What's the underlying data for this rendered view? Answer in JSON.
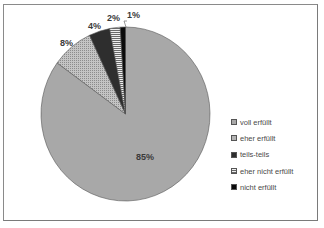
{
  "chart_data": {
    "type": "pie",
    "title": "",
    "categories": [
      "voll erfüllt",
      "eher erfüllt",
      "teils-teils",
      "eher nicht erfüllt",
      "nicht erfüllt"
    ],
    "values": [
      85,
      8,
      4,
      2,
      1
    ],
    "labels": [
      "85%",
      "8%",
      "4%",
      "2%",
      "1%"
    ],
    "colors": [
      "#a8a8a8",
      "#b4b4b4",
      "#2e2e2e",
      "#e6e6e6",
      "#0a0a0a"
    ],
    "fills": [
      "solid",
      "dotted",
      "solid-dark",
      "horizontal-stripes",
      "solid-black"
    ],
    "start_angle": "12 o'clock",
    "direction": "clockwise",
    "legend_position": "right"
  },
  "legend": {
    "items": [
      {
        "label": "voll erfüllt"
      },
      {
        "label": "eher erfüllt"
      },
      {
        "label": "teils-teils"
      },
      {
        "label": "eher nicht erfüllt"
      },
      {
        "label": "nicht erfüllt"
      }
    ]
  },
  "slice_labels": {
    "voll": "85%",
    "eher": "8%",
    "teils": "4%",
    "eher_nicht": "2%",
    "nicht": "1%"
  }
}
